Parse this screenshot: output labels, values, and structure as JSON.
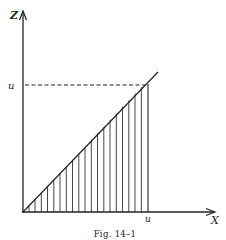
{
  "figure": {
    "caption": "Fig. 14–1",
    "axes": {
      "y_label": "Z",
      "x_label": "X"
    },
    "marks": {
      "y_tick_label": "u",
      "x_tick_label": "u"
    },
    "elements": [
      "vertical axis Z with arrow",
      "horizontal axis X with arrow",
      "diagonal line z = x through origin",
      "dashed horizontal line at z = u",
      "vertical line at x = u",
      "hatched triangular region under diagonal from 0 to u"
    ],
    "colors": {
      "ink": "#222222",
      "background": "#ffffff"
    }
  }
}
